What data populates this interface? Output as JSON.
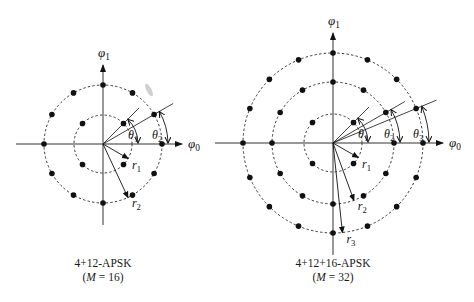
{
  "diagrams": [
    {
      "id": "apsk16",
      "title": "4+12-APSK",
      "subtitle_prefix": "(",
      "subtitle_var": "M",
      "subtitle_rest": " = 16)",
      "center": [
        103,
        144
      ],
      "rings": [
        {
          "radius": 29,
          "points": 4,
          "phase_deg": 45,
          "radius_label": "r",
          "radius_sub": "1",
          "radius_arrow_deg": -30,
          "angle_label": "θ",
          "angle_sub": "1"
        },
        {
          "radius": 59,
          "points": 12,
          "phase_deg": 0,
          "radius_label": "r",
          "radius_sub": "2",
          "radius_arrow_deg": -65,
          "angle_label": "θ",
          "angle_sub": "2"
        }
      ],
      "phase_lines_deg": [
        45,
        30
      ],
      "axis_x_label": "φ",
      "axis_x_sub": "0",
      "axis_y_label": "φ",
      "axis_y_sub": "1"
    },
    {
      "id": "apsk32",
      "title": "4+12+16-APSK",
      "subtitle_prefix": "(",
      "subtitle_var": "M",
      "subtitle_rest": " = 32)",
      "center": [
        333,
        143
      ],
      "rings": [
        {
          "radius": 29,
          "points": 4,
          "phase_deg": 45,
          "radius_label": "r",
          "radius_sub": "1",
          "radius_arrow_deg": -30,
          "angle_label": "θ",
          "angle_sub": "1"
        },
        {
          "radius": 61,
          "points": 12,
          "phase_deg": 0,
          "radius_label": "r",
          "radius_sub": "2",
          "radius_arrow_deg": -70,
          "angle_label": "θ",
          "angle_sub": "2"
        },
        {
          "radius": 90,
          "points": 16,
          "phase_deg": 0,
          "radius_label": "r",
          "radius_sub": "3",
          "radius_arrow_deg": -84,
          "angle_label": "θ",
          "angle_sub": "3"
        }
      ],
      "phase_lines_deg": [
        45,
        30,
        22.5
      ],
      "axis_x_label": "φ",
      "axis_x_sub": "0",
      "axis_y_label": "φ",
      "axis_y_sub": "1"
    }
  ],
  "colors": {
    "ink": "#111111",
    "axis": "#333333",
    "dash": "#222222",
    "smudge": "#b8b8b8"
  }
}
